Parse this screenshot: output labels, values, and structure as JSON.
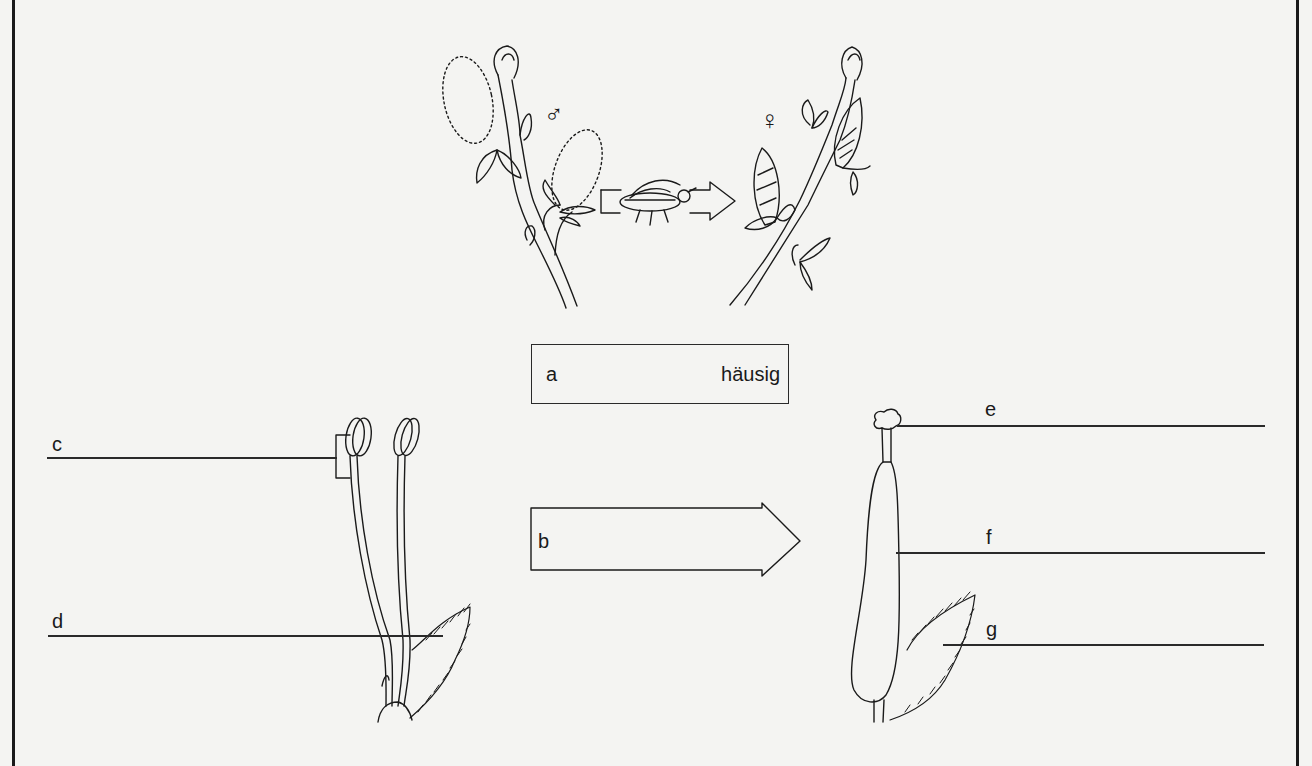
{
  "diagram": {
    "symbols": {
      "male": "♂",
      "female": "♀"
    },
    "box_a": {
      "label": "a",
      "value": "häusig"
    },
    "arrow_b": {
      "label": "b"
    },
    "labels": {
      "c": "c",
      "d": "d",
      "e": "e",
      "f": "f",
      "g": "g"
    },
    "colors": {
      "ink": "#1a1a1a",
      "paper": "#f4f4f2"
    }
  }
}
